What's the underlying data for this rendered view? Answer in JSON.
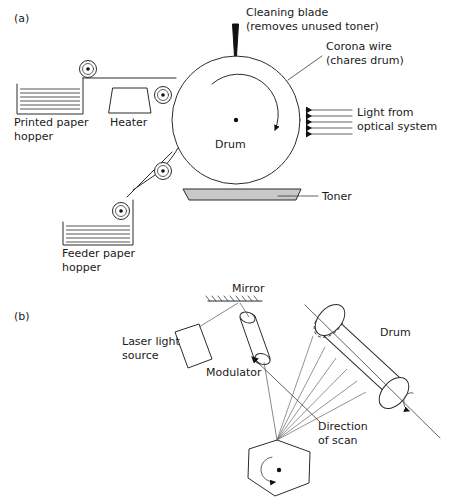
{
  "figure": {
    "panels": [
      {
        "id": "a",
        "label": "(a)"
      },
      {
        "id": "b",
        "label": "(b)"
      }
    ]
  },
  "colors": {
    "ink": "#2b2b2b",
    "blade": "#111111",
    "toner_fill": "#c9c9c9",
    "background": "#ffffff",
    "ray": "#555555"
  },
  "panel_a": {
    "labels": {
      "cleaning_blade_line1": "Cleaning blade",
      "cleaning_blade_line2": "(removes unused toner)",
      "corona_wire_line1": "Corona wire",
      "corona_wire_line2": "(chares drum)",
      "light_line1": "Light from",
      "light_line2": "optical system",
      "drum": "Drum",
      "toner": "Toner",
      "heater": "Heater",
      "printed_hopper_line1": "Printed paper",
      "printed_hopper_line2": "hopper",
      "feeder_hopper_line1": "Feeder paper",
      "feeder_hopper_line2": "hopper"
    },
    "counts": {
      "light_arrows": 5,
      "rollers": 4,
      "printed_paper_sheets": 6,
      "feeder_paper_sheets": 6
    },
    "drum": {
      "cx": 236,
      "cy": 120,
      "r": 64
    }
  },
  "panel_b": {
    "labels": {
      "mirror": "Mirror",
      "laser_line1": "Laser light",
      "laser_line2": "source",
      "modulator": "Modulator",
      "drum": "Drum",
      "scan_line1": "Direction",
      "scan_line2": "of scan"
    },
    "counts": {
      "scan_beams": 6,
      "mirror_facets": 6,
      "mirror_hatches": 9
    }
  }
}
